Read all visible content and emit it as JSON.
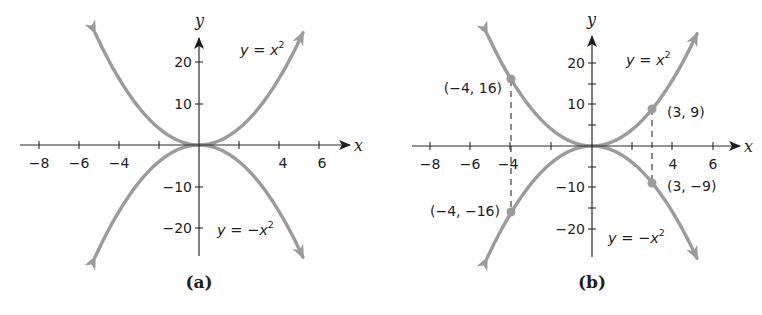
{
  "chart_data": [
    {
      "type": "line",
      "panel": "a",
      "caption": "(a)",
      "xlabel": "x",
      "ylabel": "y",
      "xlim": [
        -9,
        7
      ],
      "ylim": [
        -27,
        27
      ],
      "x_ticks": [
        -8,
        -6,
        -4,
        -2,
        2,
        4,
        6
      ],
      "x_tick_labels": [
        "−8",
        "−6",
        "−4",
        "",
        "",
        "4",
        "6"
      ],
      "y_ticks": [
        20,
        10,
        -10,
        -20
      ],
      "y_tick_labels": [
        "20",
        "10",
        "−10",
        "−20"
      ],
      "grid": false,
      "series": [
        {
          "name": "y = x²",
          "label": "y = x2",
          "function": "x^2",
          "x_range": [
            -5.2,
            5.2
          ]
        },
        {
          "name": "y = −x²",
          "label": "y = −x2",
          "function": "-x^2",
          "x_range": [
            -5.2,
            5.2
          ]
        }
      ]
    },
    {
      "type": "line",
      "panel": "b",
      "caption": "(b)",
      "xlabel": "x",
      "ylabel": "y",
      "xlim": [
        -9,
        7
      ],
      "ylim": [
        -27,
        27
      ],
      "x_ticks": [
        -8,
        -6,
        -4,
        -2,
        2,
        4,
        6
      ],
      "x_tick_labels": [
        "−8",
        "−6",
        "−4",
        "",
        "",
        "4",
        "6"
      ],
      "y_ticks": [
        20,
        15,
        10,
        5,
        -5,
        -10,
        -15,
        -20
      ],
      "y_tick_labels": [
        "20",
        "",
        "10",
        "",
        "",
        "−10",
        "",
        "−20"
      ],
      "grid": false,
      "series": [
        {
          "name": "y = x²",
          "function": "x^2",
          "x_range": [
            -5.2,
            5.2
          ]
        },
        {
          "name": "y = −x²",
          "function": "-x^2",
          "x_range": [
            -5.2,
            5.2
          ]
        }
      ],
      "points": [
        {
          "x": -4,
          "y": 16,
          "label": "(−4, 16)"
        },
        {
          "x": 3,
          "y": 9,
          "label": "(3, 9)"
        },
        {
          "x": -4,
          "y": -16,
          "label": "(−4, −16)"
        },
        {
          "x": 3,
          "y": -9,
          "label": "(3, −9)"
        }
      ],
      "dashed_guides": [
        {
          "x": -4,
          "from_y": 16,
          "to_y": -16
        },
        {
          "x": 3,
          "from_y": 9,
          "to_y": -9
        }
      ]
    }
  ],
  "panels": {
    "a": {
      "caption": "(a)",
      "x_axis_label": "x",
      "y_axis_label": "y",
      "x_ticks": [
        "−8",
        "−6",
        "−4",
        "4",
        "6"
      ],
      "y_ticks": [
        "20",
        "10",
        "−10",
        "−20"
      ],
      "eq_upper": {
        "y": "y",
        "eq": " = ",
        "x": "x",
        "sup": "2"
      },
      "eq_lower": {
        "y": "y",
        "eq": " = −",
        "x": "x",
        "sup": "2"
      }
    },
    "b": {
      "caption": "(b)",
      "x_axis_label": "x",
      "y_axis_label": "y",
      "x_ticks": [
        "−8",
        "−6",
        "−4",
        "4",
        "6"
      ],
      "y_ticks": [
        "20",
        "10",
        "−10",
        "−20"
      ],
      "eq_upper": {
        "y": "y",
        "eq": " = ",
        "x": "x",
        "sup": "2"
      },
      "eq_lower": {
        "y": "y",
        "eq": " = −",
        "x": "x",
        "sup": "2"
      },
      "points": [
        "(−4, 16)",
        "(3, 9)",
        "(−4, −16)",
        "(3, −9)"
      ]
    }
  },
  "colors": {
    "curve": "#9b9b9b",
    "axis": "#2b2b2b",
    "text": "#1e1e1e",
    "background": "#ffffff"
  }
}
